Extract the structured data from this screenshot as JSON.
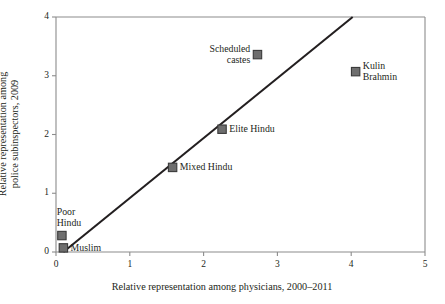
{
  "chart_data": {
    "type": "scatter",
    "title": "",
    "xlabel": "Relative representation among physicians, 2000–2011",
    "ylabel_line1": "Relative representation among",
    "ylabel_line2": "police subinspectors, 2009",
    "xlim": [
      0,
      5
    ],
    "ylim": [
      0,
      4
    ],
    "xticks": [
      "0",
      "1",
      "2",
      "3",
      "4",
      "5"
    ],
    "yticks": [
      "0",
      "1",
      "2",
      "3",
      "4"
    ],
    "xtick_values": [
      0,
      1,
      2,
      3,
      4,
      5
    ],
    "ytick_values": [
      0,
      1,
      2,
      3,
      4
    ],
    "grid": false,
    "legend": "none",
    "marker_color": "#6e6e6e",
    "marker_edge_color": "#3a3a3a",
    "line_color": "#231f20",
    "axis_color": "#8c8c8c",
    "points": [
      {
        "label_line1": "Muslim",
        "label_line2": "",
        "x": 0.1,
        "y": 0.07,
        "label_position": "right"
      },
      {
        "label_line1": "Poor",
        "label_line2": "Hindu",
        "x": 0.08,
        "y": 0.28,
        "label_position": "above"
      },
      {
        "label_line1": "Mixed Hindu",
        "label_line2": "",
        "x": 1.58,
        "y": 1.44,
        "label_position": "right"
      },
      {
        "label_line1": "Elite Hindu",
        "label_line2": "",
        "x": 2.25,
        "y": 2.09,
        "label_position": "right"
      },
      {
        "label_line1": "Scheduled",
        "label_line2": "castes",
        "x": 2.73,
        "y": 3.36,
        "label_position": "left"
      },
      {
        "label_line1": "Kulin",
        "label_line2": "Brahmin",
        "x": 4.06,
        "y": 3.07,
        "label_position": "right"
      }
    ],
    "fit_line": {
      "x_start": 0.1,
      "y_start": 0.0,
      "x_end": 4.02,
      "y_end": 4.0
    }
  }
}
